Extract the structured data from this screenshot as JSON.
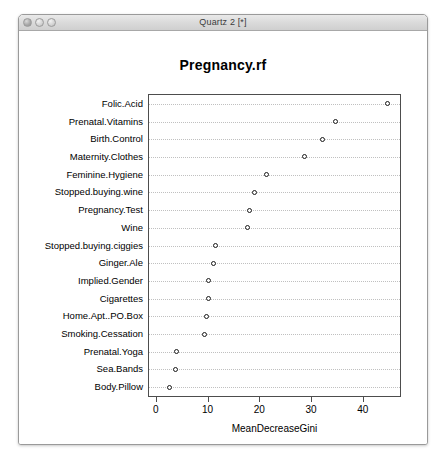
{
  "window": {
    "title": "Quartz 2 [*]",
    "controls": [
      {
        "name": "close",
        "label": "close"
      },
      {
        "name": "minimize",
        "label": "minimize"
      },
      {
        "name": "zoom",
        "label": "zoom"
      }
    ]
  },
  "chart_data": {
    "type": "scatter",
    "title": "Pregnancy.rf",
    "xlabel": "MeanDecreaseGini",
    "ylabel": "",
    "xlim": [
      -1.5,
      47
    ],
    "xticks": [
      0,
      10,
      20,
      30,
      40
    ],
    "xticklabels": [
      "0",
      "10",
      "20",
      "30",
      "40"
    ],
    "grid": "horizontal-dotted",
    "legend": null,
    "marker": "open-circle",
    "categories": [
      "Folic.Acid",
      "Prenatal.Vitamins",
      "Birth.Control",
      "Maternity.Clothes",
      "Feminine.Hygiene",
      "Stopped.buying.wine",
      "Pregnancy.Test",
      "Wine",
      "Stopped.buying.ciggies",
      "Ginger.Ale",
      "Implied.Gender",
      "Cigarettes",
      "Home.Apt..PO.Box",
      "Smoking.Cessation",
      "Prenatal.Yoga",
      "Sea.Bands",
      "Body.Pillow"
    ],
    "values": [
      44.5,
      34.5,
      32.0,
      28.6,
      21.2,
      18.8,
      18.0,
      17.5,
      11.4,
      11.0,
      10.0,
      10.0,
      9.6,
      9.2,
      3.9,
      3.7,
      2.5
    ]
  },
  "colors": {
    "point_stroke": "#1a1a1a",
    "panel_border": "#4d4d4d",
    "gridline": "#c0c0c0",
    "text": "#000000",
    "titlebar": "#dcdcdc"
  }
}
